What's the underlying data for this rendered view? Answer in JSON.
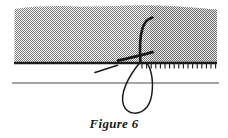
{
  "figure": {
    "caption": "Figure 6",
    "caption_position": {
      "x": 114,
      "y": 127
    },
    "alt_description": "Cross-section diagram: hatched medium above a ground line with a stem and root loop crossing the boundary",
    "colors": {
      "hatch_fill": "#8c8c8c",
      "hatch_dither_dark": "#6e6e6e",
      "ink": "#1a1a1a",
      "thin_line": "#4a4a4a",
      "background": "#ffffff"
    },
    "hatched_region": {
      "name": "dithered-gray-block",
      "left": 14,
      "right": 217,
      "top": 5,
      "bottom": 62,
      "fill_style": "checkerboard-dither-50-percent",
      "top_edge": "irregular-wavy"
    },
    "ground_line": {
      "name": "thick-baseline",
      "y": 63,
      "x_start": 14,
      "x_end": 217,
      "thickness": 2.4
    },
    "lower_line": {
      "name": "thin-lower-line",
      "y": 83,
      "x_start": 12,
      "x_end": 219,
      "thickness": 1.1
    },
    "tick_marks": {
      "name": "baseline-hatch-ticks",
      "count": 17,
      "x_first": 142,
      "x_last": 216,
      "y_top": 63,
      "length": 5,
      "side": "below-baseline"
    },
    "stem": {
      "name": "curved-stem",
      "path": "M 141 62 C 140 48 140 36 143 27 C 145 22 149 19 152 18",
      "thickness": 2.6
    },
    "branch": {
      "name": "horizontal-branch",
      "path": "M 118 60 L 152 52",
      "thickness": 2.8
    },
    "loop": {
      "name": "root-loop",
      "path": "M 140 62 C 130 76 120 94 124 106 C 128 116 140 116 147 108 C 154 99 154 80 150 68 C 148 64 146 62 145 62",
      "thickness": 1.6
    },
    "small_tick": {
      "name": "short-diagonal-mark",
      "path": "M 95 72 L 117 65",
      "thickness": 1.6
    }
  }
}
